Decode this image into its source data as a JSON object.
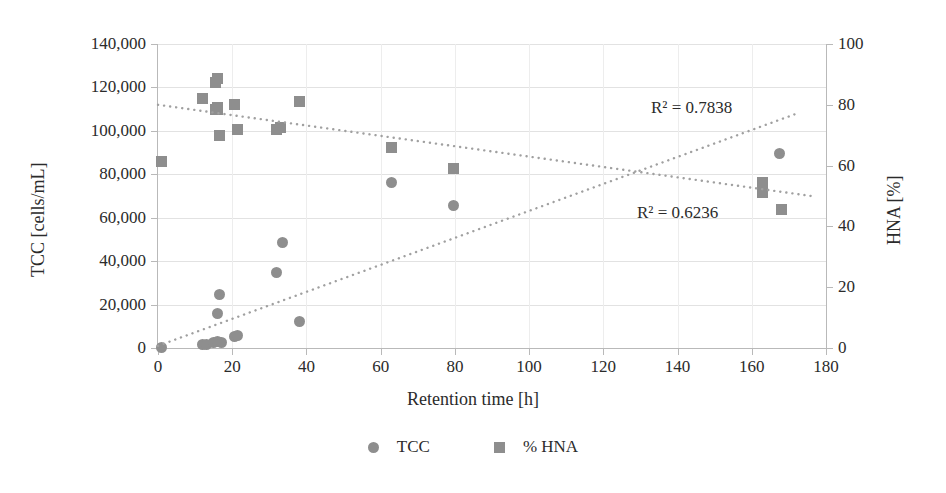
{
  "chart_data": {
    "type": "scatter",
    "title": "",
    "xlabel": "Retention time [h]",
    "ylabel": "TCC [cells/mL]",
    "y2label": "HNA [%]",
    "xlim": [
      0,
      180
    ],
    "ylim": [
      0,
      140000
    ],
    "y2lim": [
      0,
      100
    ],
    "grid": true,
    "legend_position": "bottom",
    "xticks": [
      "0",
      "20",
      "40",
      "60",
      "80",
      "100",
      "120",
      "140",
      "160",
      "180"
    ],
    "xtick_values": [
      0,
      20,
      40,
      60,
      80,
      100,
      120,
      140,
      160,
      180
    ],
    "yticks": [
      "0",
      "20,000",
      "40,000",
      "60,000",
      "80,000",
      "100,000",
      "120,000",
      "140,000"
    ],
    "ytick_values": [
      0,
      20000,
      40000,
      60000,
      80000,
      100000,
      120000,
      140000
    ],
    "y2ticks": [
      "0",
      "20",
      "40",
      "60",
      "80",
      "100"
    ],
    "y2tick_values": [
      0,
      20,
      40,
      60,
      80,
      100
    ],
    "marker_color": "#8e8e8e",
    "trendline_color": "#a0a0a0",
    "grid_color": "#e2e2e2",
    "series": [
      {
        "name": "TCC",
        "axis": "left",
        "marker": "circle",
        "points": [
          [
            1,
            400
          ],
          [
            12,
            1600
          ],
          [
            13,
            1400
          ],
          [
            15,
            2600
          ],
          [
            16,
            2900
          ],
          [
            16,
            15900
          ],
          [
            16.5,
            24500
          ],
          [
            17,
            2500
          ],
          [
            20.5,
            5300
          ],
          [
            21.5,
            5600
          ],
          [
            32,
            34600
          ],
          [
            33.5,
            48800
          ],
          [
            38,
            12200
          ],
          [
            63,
            76200
          ],
          [
            79.5,
            65600
          ],
          [
            167.5,
            89600
          ]
        ]
      },
      {
        "name": "% HNA",
        "axis": "right",
        "marker": "square",
        "points": [
          [
            1,
            61.5
          ],
          [
            12,
            82
          ],
          [
            15.5,
            87.5
          ],
          [
            16,
            88.5
          ],
          [
            15.5,
            78.5
          ],
          [
            16,
            78.5
          ],
          [
            16,
            79
          ],
          [
            16.5,
            70
          ],
          [
            20.5,
            80
          ],
          [
            21.5,
            72
          ],
          [
            32,
            72
          ],
          [
            33,
            72.5
          ],
          [
            38,
            81
          ],
          [
            63,
            66
          ],
          [
            79.5,
            59
          ],
          [
            163,
            54.5
          ],
          [
            163,
            53
          ],
          [
            163,
            51
          ],
          [
            168,
            45.5
          ]
        ]
      }
    ],
    "trendlines": [
      {
        "for": "% HNA",
        "axis": "right",
        "r2_label": "R² = 0.6236",
        "x_start": 0,
        "x_end": 176,
        "y_start": 80,
        "y_end": 50
      },
      {
        "for": "TCC",
        "axis": "left",
        "r2_label": "R² = 0.7838",
        "x_start": 0,
        "x_end": 173,
        "y_start": 1000,
        "y_end": 108500
      }
    ],
    "legend": [
      {
        "label": "TCC",
        "marker": "circle",
        "color": "#8e8e8e"
      },
      {
        "label": "% HNA",
        "marker": "square",
        "color": "#8e8e8e"
      }
    ],
    "annotations": [
      {
        "text": "R² = 0.7838",
        "name": "r2-hna-trend"
      },
      {
        "text": "R² = 0.6236",
        "name": "r2-tcc-trend"
      }
    ]
  }
}
